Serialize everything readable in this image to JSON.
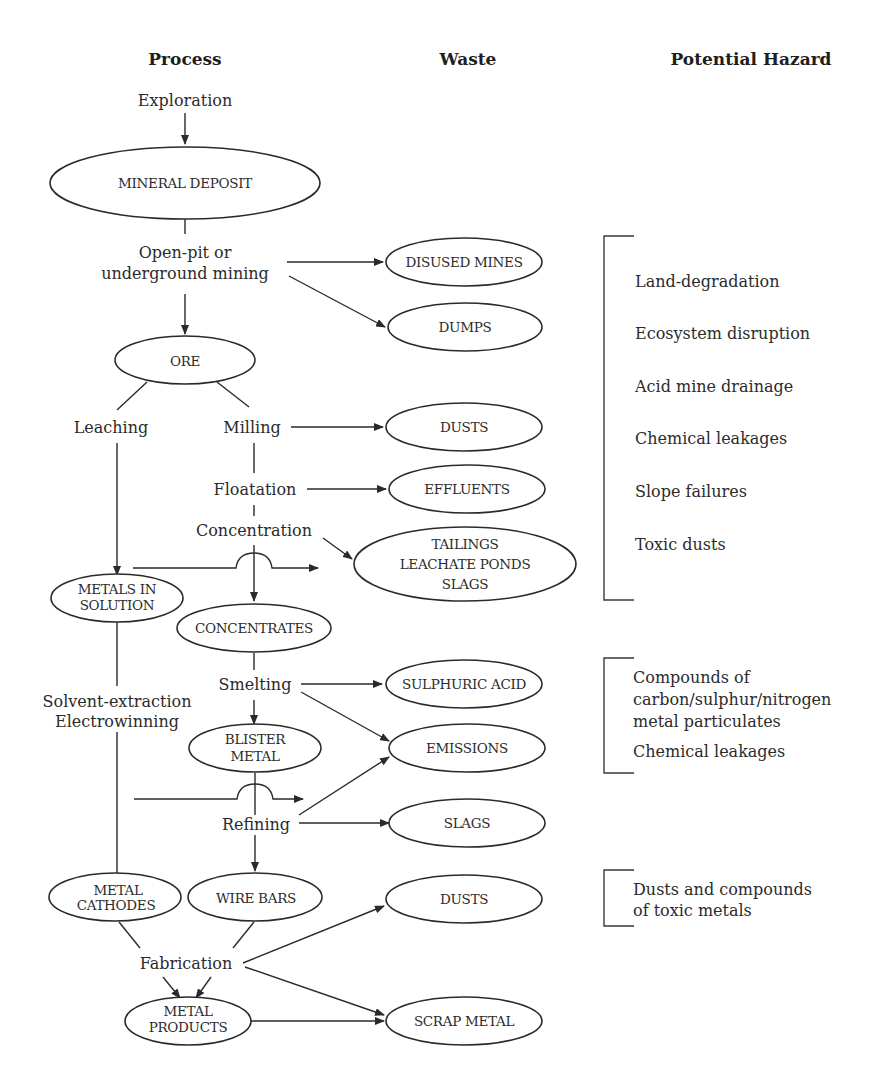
{
  "headers": {
    "process": "Process",
    "waste": "Waste",
    "hazard": "Potential Hazard"
  },
  "process_steps": {
    "exploration": "Exploration",
    "mining_line1": "Open-pit or",
    "mining_line2": "underground mining",
    "leaching": "Leaching",
    "milling": "Milling",
    "floatation": "Floatation",
    "concentration": "Concentration",
    "sx_line1": "Solvent-extraction",
    "sx_line2": "Electrowinning",
    "smelting": "Smelting",
    "refining": "Refining",
    "fabrication": "Fabrication"
  },
  "product_nodes": {
    "mineral_deposit": "MINERAL DEPOSIT",
    "ore": "ORE",
    "metals_in_solution_1": "METALS IN",
    "metals_in_solution_2": "SOLUTION",
    "concentrates": "CONCENTRATES",
    "blister_metal_1": "BLISTER",
    "blister_metal_2": "METAL",
    "metal_cathodes_1": "METAL",
    "metal_cathodes_2": "CATHODES",
    "wire_bars": "WIRE BARS",
    "metal_products_1": "METAL",
    "metal_products_2": "PRODUCTS"
  },
  "waste_nodes": {
    "disused_mines": "DISUSED MINES",
    "dumps": "DUMPS",
    "dusts_1": "DUSTS",
    "effluents": "EFFLUENTS",
    "tailings_1": "TAILINGS",
    "tailings_2": "LEACHATE PONDS",
    "tailings_3": "SLAGS",
    "sulphuric_acid": "SULPHURIC ACID",
    "emissions": "EMISSIONS",
    "slags": "SLAGS",
    "dusts_2": "DUSTS",
    "scrap_metal": "SCRAP METAL"
  },
  "hazard_groups": [
    {
      "items": [
        "Land-degradation",
        "Ecosystem disruption",
        "Acid mine drainage",
        "Chemical leakages",
        "Slope failures",
        "Toxic dusts"
      ]
    },
    {
      "items": [
        "Compounds of",
        "carbon/sulphur/nitrogen",
        "metal particulates",
        "Chemical leakages"
      ]
    },
    {
      "items": [
        "Dusts and compounds",
        "of toxic metals"
      ]
    }
  ]
}
